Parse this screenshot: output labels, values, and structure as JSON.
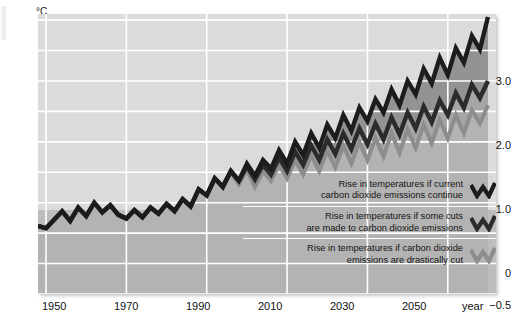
{
  "title": "Expected change in global temperature",
  "unit": "°C",
  "xaxis_title": "year",
  "yticks": [
    {
      "label": "+3.0",
      "value": 3.0
    },
    {
      "label": "+2.0",
      "value": 2.0
    },
    {
      "label": "+1.0",
      "value": 1.0
    },
    {
      "label": "0",
      "value": 0
    },
    {
      "label": "−0.5",
      "value": -0.5
    }
  ],
  "xticks": [
    {
      "label": "1950",
      "value": 1950
    },
    {
      "label": "1970",
      "value": 1970
    },
    {
      "label": "1990",
      "value": 1990
    },
    {
      "label": "2010",
      "value": 2010
    },
    {
      "label": "2030",
      "value": 2030
    },
    {
      "label": "2050",
      "value": 2050
    }
  ],
  "legend": [
    {
      "label": "Rise in temperatures if current\ncarbon dioxide emissions continue",
      "color": "#1c1c1c",
      "series": "high"
    },
    {
      "label": "Rise in temperatures if some cuts\nare made to carbon dioxide emissions",
      "color": "#2a2a2a",
      "series": "medium"
    },
    {
      "label": "Rise in temperatures if carbon dioxide\nemissions are drastically cut",
      "color": "#8d8d8d",
      "series": "low"
    }
  ],
  "colors": {
    "plot_bg_upper": "#dcdcdc",
    "plot_bg_lower": "#b9b9b9",
    "grid": "#ffffff",
    "line_high": "#1c1c1c",
    "line_medium": "#2b2b2b",
    "line_low": "#8d8d8d",
    "fill_high": "#8f8f8f",
    "fill_medium": "#a2a2a2",
    "fill_low": "#b0b0b0",
    "text": "#111111"
  },
  "chart_data": {
    "type": "line",
    "title": "Expected change in global temperature",
    "xlabel": "year",
    "ylabel": "°C",
    "xlim": [
      1948,
      2062
    ],
    "ylim": [
      -0.5,
      4.1
    ],
    "grid": true,
    "legend_position": "inside-bottom-right",
    "ygridlines": [
      -0.5,
      0,
      0.5,
      1.0,
      1.5,
      2.0,
      2.5,
      3.0,
      3.5,
      4.0
    ],
    "xgridlines": [
      1950,
      1970,
      1990,
      2010,
      2030,
      2050
    ],
    "note": "Historical record to ~2000 is a single shared line; three scenario projections diverge thereafter.",
    "x": [
      1948,
      1950,
      1952,
      1954,
      1956,
      1958,
      1960,
      1962,
      1964,
      1966,
      1968,
      1970,
      1972,
      1974,
      1976,
      1978,
      1980,
      1982,
      1984,
      1986,
      1988,
      1990,
      1992,
      1994,
      1996,
      1998,
      2000,
      2002,
      2004,
      2006,
      2008,
      2010,
      2012,
      2014,
      2016,
      2018,
      2020,
      2022,
      2024,
      2026,
      2028,
      2030,
      2032,
      2034,
      2036,
      2038,
      2040,
      2042,
      2044,
      2046,
      2048,
      2050,
      2052,
      2054,
      2056,
      2058,
      2060
    ],
    "series": [
      {
        "name": "Rise in temperatures if current carbon dioxide emissions continue",
        "color": "#1c1c1c",
        "values": [
          0.62,
          0.58,
          0.72,
          0.86,
          0.7,
          0.92,
          0.78,
          1.0,
          0.84,
          0.96,
          0.8,
          0.74,
          0.88,
          0.76,
          0.92,
          0.82,
          0.98,
          0.86,
          1.06,
          0.94,
          1.22,
          1.12,
          1.4,
          1.26,
          1.52,
          1.36,
          1.64,
          1.44,
          1.7,
          1.56,
          1.86,
          1.64,
          2.0,
          1.78,
          2.14,
          1.9,
          2.28,
          2.06,
          2.44,
          2.18,
          2.56,
          2.34,
          2.7,
          2.48,
          2.86,
          2.6,
          3.0,
          2.78,
          3.2,
          2.96,
          3.38,
          3.1,
          3.54,
          3.3,
          3.74,
          3.52,
          4.05
        ]
      },
      {
        "name": "Rise in temperatures if some cuts are made to carbon dioxide emissions",
        "color": "#2b2b2b",
        "values": [
          0.62,
          0.58,
          0.72,
          0.86,
          0.7,
          0.92,
          0.78,
          1.0,
          0.84,
          0.96,
          0.8,
          0.74,
          0.88,
          0.76,
          0.92,
          0.82,
          0.98,
          0.86,
          1.06,
          0.94,
          1.22,
          1.12,
          1.4,
          1.26,
          1.52,
          1.36,
          1.6,
          1.38,
          1.62,
          1.46,
          1.74,
          1.52,
          1.84,
          1.62,
          1.94,
          1.7,
          2.04,
          1.8,
          2.14,
          1.88,
          2.22,
          1.96,
          2.3,
          2.04,
          2.4,
          2.12,
          2.48,
          2.22,
          2.58,
          2.32,
          2.68,
          2.44,
          2.8,
          2.56,
          2.94,
          2.72,
          3.0
        ]
      },
      {
        "name": "Rise in temperatures if carbon dioxide emissions are drastically cut",
        "color": "#8d8d8d",
        "values": [
          0.62,
          0.58,
          0.72,
          0.86,
          0.7,
          0.92,
          0.78,
          1.0,
          0.84,
          0.96,
          0.8,
          0.74,
          0.88,
          0.76,
          0.92,
          0.82,
          0.98,
          0.86,
          1.06,
          0.94,
          1.22,
          1.12,
          1.4,
          1.26,
          1.5,
          1.3,
          1.54,
          1.26,
          1.52,
          1.36,
          1.62,
          1.4,
          1.7,
          1.46,
          1.78,
          1.52,
          1.86,
          1.58,
          1.94,
          1.64,
          2.0,
          1.7,
          2.06,
          1.76,
          2.14,
          1.82,
          2.2,
          1.9,
          2.28,
          1.98,
          2.36,
          2.06,
          2.44,
          2.14,
          2.52,
          2.3,
          2.6
        ]
      }
    ]
  }
}
